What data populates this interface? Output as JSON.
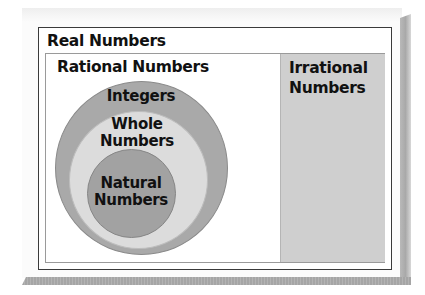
{
  "diagram": {
    "type": "nested-sets",
    "title": "Real Numbers",
    "sets": {
      "real": {
        "label": "Real Numbers"
      },
      "rational": {
        "label": "Rational Numbers"
      },
      "irrational": {
        "label_line1": "Irrational",
        "label_line2": "Numbers"
      },
      "integers": {
        "label": "Integers"
      },
      "whole": {
        "label_line1": "Whole",
        "label_line2": "Numbers"
      },
      "natural": {
        "label_line1": "Natural",
        "label_line2": "Numbers"
      }
    },
    "hierarchy": [
      "Real Numbers contains Rational Numbers and Irrational Numbers",
      "Rational Numbers contains Integers",
      "Integers contains Whole Numbers",
      "Whole Numbers contains Natural Numbers"
    ],
    "colors": {
      "integers_ring": "#a9a9a9",
      "whole_ring": "#dcdcdc",
      "natural_core": "#a2a2a2",
      "irrational_region": "#cfcfcf",
      "border": "#3a3a3a"
    }
  }
}
